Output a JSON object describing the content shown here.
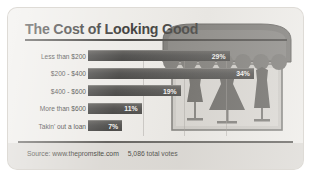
{
  "title": "The Cost of Looking Good",
  "footer": {
    "source": "Source: www.thepromsite.com",
    "votes": "5,086 total votes"
  },
  "colors": {
    "card_background": "#eceae6",
    "bar": "#434240",
    "title_text": "#2e2d2b",
    "rule": "#3a3835",
    "footer_band": "#d9d6d1",
    "awning": "#6f6d69",
    "dress": "#5a5854"
  },
  "illustration": {
    "name": "dress-shop",
    "awning_scallops": 7,
    "dresses": [
      "small-dress",
      "ballgown-dress",
      "long-gown-dress"
    ]
  },
  "chart_data": {
    "type": "bar",
    "orientation": "horizontal",
    "title": "The Cost of Looking Good",
    "xlabel": "",
    "ylabel": "",
    "xlim": [
      0,
      34
    ],
    "grid": true,
    "legend": false,
    "categories": [
      "Less than $200",
      "$200 - $400",
      "$400 - $600",
      "More than $600",
      "Takin' out a loan"
    ],
    "values": [
      29,
      34,
      19,
      11,
      7
    ],
    "value_labels": [
      "29%",
      "34%",
      "19%",
      "11%",
      "7%"
    ]
  }
}
